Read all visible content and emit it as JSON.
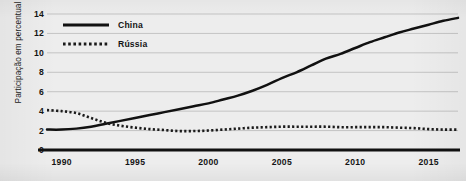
{
  "chart_data": {
    "type": "line",
    "title": "",
    "xlabel": "",
    "ylabel": "Participação em percentual",
    "xlim": [
      1989,
      2017
    ],
    "ylim": [
      0,
      14
    ],
    "ytick_labels": [
      "0",
      "2",
      "4",
      "6",
      "8",
      "10",
      "12",
      "14"
    ],
    "ytick_values": [
      0,
      2,
      4,
      6,
      8,
      10,
      12,
      14
    ],
    "xtick_labels": [
      "1990",
      "1995",
      "2000",
      "2005",
      "2010",
      "2015"
    ],
    "xtick_values": [
      1990,
      1995,
      2000,
      2005,
      2010,
      2015
    ],
    "grid": "horizontal",
    "legend_position": "top-left",
    "x": [
      1989,
      1990,
      1991,
      1992,
      1993,
      1994,
      1995,
      1996,
      1997,
      1998,
      1999,
      2000,
      2001,
      2002,
      2003,
      2004,
      2005,
      2006,
      2007,
      2008,
      2009,
      2010,
      2011,
      2012,
      2013,
      2014,
      2015,
      2016,
      2017
    ],
    "series": [
      {
        "name": "China",
        "style": "solid",
        "color": "#111111",
        "values": [
          2.1,
          2.1,
          2.2,
          2.4,
          2.7,
          3.0,
          3.3,
          3.6,
          3.9,
          4.2,
          4.5,
          4.8,
          5.2,
          5.6,
          6.1,
          6.7,
          7.4,
          8.0,
          8.7,
          9.4,
          9.9,
          10.5,
          11.1,
          11.6,
          12.1,
          12.5,
          12.9,
          13.3,
          13.6
        ]
      },
      {
        "name": "Rússia",
        "style": "dotted",
        "color": "#1a1a1a",
        "values": [
          4.1,
          4.0,
          3.8,
          3.3,
          2.8,
          2.5,
          2.3,
          2.15,
          2.05,
          1.95,
          1.95,
          2.0,
          2.1,
          2.2,
          2.3,
          2.35,
          2.4,
          2.4,
          2.4,
          2.4,
          2.35,
          2.35,
          2.35,
          2.35,
          2.3,
          2.25,
          2.15,
          2.1,
          2.1
        ]
      }
    ]
  },
  "legend": {
    "items": [
      {
        "label": "China",
        "style": "solid"
      },
      {
        "label": "Rússia",
        "style": "dotted"
      }
    ]
  },
  "axis": {
    "y_title": "Participação em percentual"
  },
  "colors": {
    "background": "#ededed",
    "gridline": "#b9b9b9",
    "axis": "#111111",
    "series_china": "#111111",
    "series_russia": "#1a1a1a"
  }
}
